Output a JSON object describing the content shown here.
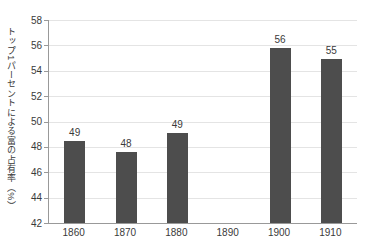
{
  "chart_data": {
    "type": "bar",
    "title": "",
    "xlabel": "",
    "ylabel": "トップ1パーセントによる富の占有率（%）",
    "categories": [
      "1860",
      "1870",
      "1880",
      "1890",
      "1900",
      "1910"
    ],
    "values": [
      49,
      48,
      49,
      null,
      56,
      55
    ],
    "bar_labels": [
      "49",
      "48",
      "49",
      "",
      "56",
      "55"
    ],
    "bar_tops": [
      48.5,
      47.6,
      49.1,
      null,
      55.8,
      54.9
    ],
    "y_ticks": [
      42,
      44,
      46,
      48,
      50,
      52,
      54,
      56,
      58
    ],
    "ylim": [
      42,
      58
    ],
    "grid": "horizontal",
    "legend": "none",
    "colors": {
      "bar": "#4d4d4d",
      "axis": "#999999",
      "grid": "#e4e4e4",
      "text": "#3a3a3a"
    }
  }
}
